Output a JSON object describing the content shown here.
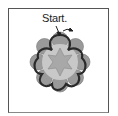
{
  "figure": {
    "start_label": "Start.",
    "colors": {
      "frame": "#555555",
      "petal_fill": "#9a9a9a",
      "inner_fill": "#c8c8c8",
      "star_fill": "#a8a8a8",
      "outline": "#2a2a2a",
      "arrow": "#222222"
    },
    "petals": 8,
    "star_points": 6
  }
}
